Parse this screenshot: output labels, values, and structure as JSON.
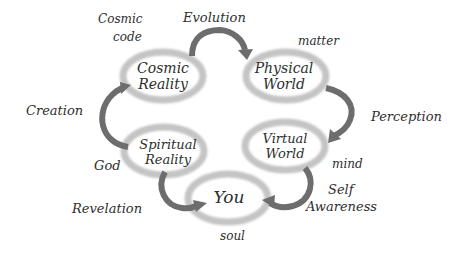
{
  "diagram": {
    "nodes": [
      {
        "id": "cosmic-reality",
        "line1": "Cosmic",
        "line2": "Reality"
      },
      {
        "id": "physical-world",
        "line1": "Physical",
        "line2": "World"
      },
      {
        "id": "spiritual-reality",
        "line1": "Spiritual",
        "line2": "Reality"
      },
      {
        "id": "virtual-world",
        "line1": "Virtual",
        "line2": "World"
      },
      {
        "id": "you",
        "line1": "You"
      }
    ],
    "edges": [
      {
        "from": "spiritual-reality",
        "to": "cosmic-reality",
        "label": "Creation"
      },
      {
        "from": "cosmic-reality",
        "to": "physical-world",
        "label": "Evolution"
      },
      {
        "from": "physical-world",
        "to": "virtual-world",
        "label": "Perception"
      },
      {
        "from": "virtual-world",
        "to": "you",
        "label_line1": "Self",
        "label_line2": "Awareness"
      },
      {
        "from": "spiritual-reality",
        "to": "you",
        "label": "Revelation"
      }
    ],
    "annotations": {
      "cosmic_code_line1": "Cosmic",
      "cosmic_code_line2": "code",
      "matter": "matter",
      "god": "God",
      "mind": "mind",
      "soul": "soul"
    },
    "colors": {
      "ring": "#c4c4c4",
      "arrow": "#6d6d6d",
      "text": "#2e2e2e",
      "background": "#ffffff"
    }
  }
}
